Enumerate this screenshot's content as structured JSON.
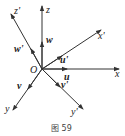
{
  "figure": {
    "caption": "图 59",
    "origin_label": "O",
    "axes": [
      {
        "name": "x",
        "label": "x"
      },
      {
        "name": "y",
        "label": "y"
      },
      {
        "name": "z",
        "label": "z"
      },
      {
        "name": "x-prime",
        "label": "x'"
      },
      {
        "name": "y-prime",
        "label": "y'"
      },
      {
        "name": "z-prime",
        "label": "z'"
      }
    ],
    "vectors": [
      {
        "name": "u",
        "label": "u"
      },
      {
        "name": "v",
        "label": "v"
      },
      {
        "name": "w",
        "label": "w"
      },
      {
        "name": "u-prime",
        "label": "u'"
      },
      {
        "name": "v-prime",
        "label": "v'"
      },
      {
        "name": "w-prime",
        "label": "w'"
      }
    ],
    "colors": {
      "line": "#333333",
      "background": "#ffffff"
    }
  }
}
